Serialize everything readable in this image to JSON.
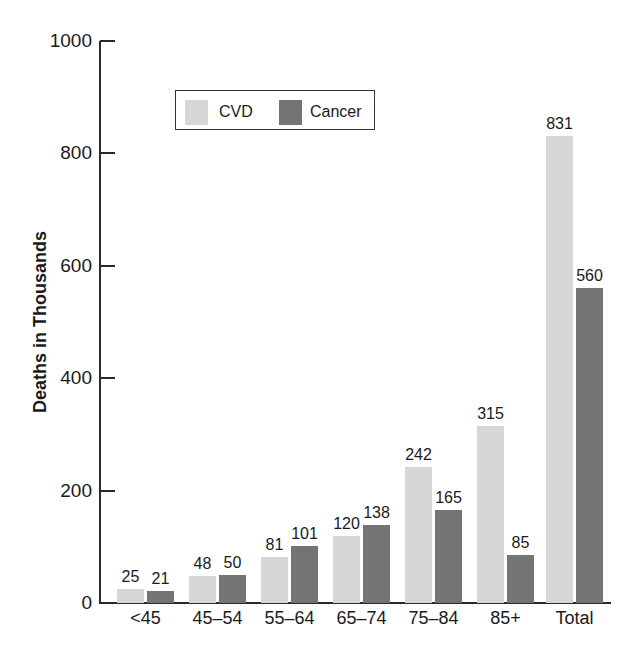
{
  "chart_data": {
    "type": "bar",
    "title": "",
    "xlabel": "",
    "ylabel": "Deaths in Thousands",
    "ylim": [
      0,
      1000
    ],
    "yticks": [
      0,
      200,
      400,
      600,
      800,
      1000
    ],
    "categories": [
      "<45",
      "45–54",
      "55–64",
      "65–74",
      "75–84",
      "85+",
      "Total"
    ],
    "series": [
      {
        "name": "CVD",
        "color": "#d6d6d6",
        "values": [
          25,
          48,
          81,
          120,
          242,
          315,
          831
        ]
      },
      {
        "name": "Cancer",
        "color": "#747474",
        "values": [
          21,
          50,
          101,
          138,
          165,
          85,
          560
        ]
      }
    ],
    "grid": false,
    "legend_position": "upper-left-inside",
    "data_labels": true
  },
  "axis": {
    "y_title": "Deaths in Thousands",
    "y_ticks": [
      "0",
      "200",
      "400",
      "600",
      "800",
      "1000"
    ]
  },
  "legend": {
    "items": [
      {
        "label": "CVD",
        "color": "#d6d6d6"
      },
      {
        "label": "Cancer",
        "color": "#747474"
      }
    ]
  }
}
